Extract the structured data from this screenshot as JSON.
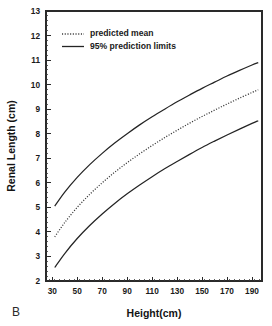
{
  "panel": {
    "label": "B"
  },
  "chart_data": {
    "type": "line",
    "title": "",
    "xlabel": "Height(cm)",
    "ylabel": "Renal Length (cm)",
    "xlim": [
      25,
      198
    ],
    "ylim": [
      2,
      13
    ],
    "xticks": [
      30,
      50,
      70,
      90,
      110,
      130,
      150,
      170,
      190
    ],
    "yticks": [
      2,
      3,
      4,
      5,
      6,
      7,
      8,
      9,
      10,
      11,
      12,
      13
    ],
    "xtick_labels": [
      "30",
      "50",
      "70",
      "90",
      "110",
      "130",
      "150",
      "170",
      "190"
    ],
    "ytick_labels": [
      "2",
      "3",
      "4",
      "5",
      "6",
      "7",
      "8",
      "9",
      "10",
      "11",
      "12",
      "13"
    ],
    "grid": false,
    "legend_position": "top-left",
    "x": [
      32,
      40,
      50,
      60,
      70,
      80,
      90,
      100,
      110,
      120,
      130,
      140,
      150,
      160,
      170,
      180,
      190,
      195
    ],
    "series": [
      {
        "name": "95% prediction limits",
        "role": "upper-limit",
        "style": "solid",
        "color": "#242424",
        "values": [
          5.05,
          5.62,
          6.22,
          6.74,
          7.2,
          7.62,
          8.0,
          8.36,
          8.69,
          9.0,
          9.3,
          9.58,
          9.85,
          10.1,
          10.35,
          10.58,
          10.8,
          10.9
        ]
      },
      {
        "name": "predicted mean",
        "role": "mean",
        "style": "dotted",
        "color": "#383838",
        "values": [
          3.8,
          4.38,
          5.0,
          5.53,
          6.0,
          6.43,
          6.82,
          7.18,
          7.52,
          7.84,
          8.14,
          8.43,
          8.7,
          8.96,
          9.21,
          9.45,
          9.68,
          9.79
        ]
      },
      {
        "name": "95% prediction limits",
        "role": "lower-limit",
        "style": "solid",
        "color": "#242424",
        "values": [
          2.55,
          3.12,
          3.73,
          4.26,
          4.73,
          5.16,
          5.55,
          5.91,
          6.25,
          6.57,
          6.87,
          7.16,
          7.44,
          7.7,
          7.95,
          8.19,
          8.42,
          8.53
        ]
      }
    ],
    "legend": [
      {
        "label": "predicted mean",
        "style": "dotted"
      },
      {
        "label": "95% prediction limits",
        "style": "solid"
      }
    ]
  }
}
